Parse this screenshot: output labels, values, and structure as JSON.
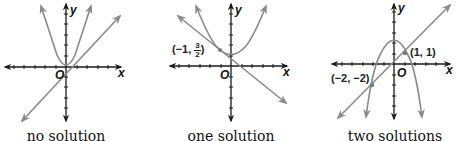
{
  "colors": {
    "axis": "#1a1a1a",
    "curve": "#8a8a8a",
    "point": "#7a7a7a",
    "text": "#111111"
  },
  "panels": [
    {
      "id": "no-solution",
      "caption": "no solution",
      "axis_labels": {
        "x": "x",
        "y": "y",
        "origin": "O"
      },
      "curves": [
        {
          "type": "parabola",
          "opens": "up",
          "description": "upward parabola with vertex at about (0, 0.2)"
        },
        {
          "type": "line",
          "slope": "positive",
          "description": "line y = x - 0.5 approx, not touching parabola"
        }
      ],
      "points": []
    },
    {
      "id": "one-solution",
      "caption": "one solution",
      "axis_labels": {
        "x": "x",
        "y": "y",
        "origin": "O"
      },
      "curves": [
        {
          "type": "parabola",
          "opens": "up",
          "description": "upward parabola with vertex near (0, 1)"
        },
        {
          "type": "line",
          "slope": "negative",
          "description": "line tangent to parabola"
        }
      ],
      "points": [
        {
          "label_prefix": "(−1,",
          "frac_num": "3",
          "frac_den": "2",
          "label_suffix": ")",
          "x": -1,
          "y": 1.5
        }
      ]
    },
    {
      "id": "two-solutions",
      "caption": "two solutions",
      "axis_labels": {
        "x": "x",
        "y": "y",
        "origin": "O"
      },
      "curves": [
        {
          "type": "parabola",
          "opens": "down",
          "description": "downward parabola with vertex near (0, 2)"
        },
        {
          "type": "line",
          "slope": "positive",
          "description": "line y = x intersecting parabola twice"
        }
      ],
      "points": [
        {
          "label": "(1, 1)",
          "x": 1,
          "y": 1
        },
        {
          "label": "(−2, −2)",
          "x": -2,
          "y": -2
        }
      ]
    }
  ]
}
